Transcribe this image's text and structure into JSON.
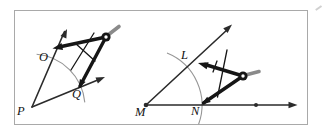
{
  "diagram": {
    "left_figure": {
      "vertex_label": "P",
      "upper_intersection_label": "O",
      "lower_intersection_label": "Q"
    },
    "right_figure": {
      "vertex_label": "M",
      "baseline_intersection_label": "N",
      "upper_intersection_label": "L"
    }
  },
  "colors": {
    "ray": "#2b2b2b",
    "arc": "#969696",
    "compass": "#161616",
    "compass_handle": "#8a8a8a",
    "border": "#a9a9a9",
    "label": "#111111",
    "background": "#ffffff"
  }
}
